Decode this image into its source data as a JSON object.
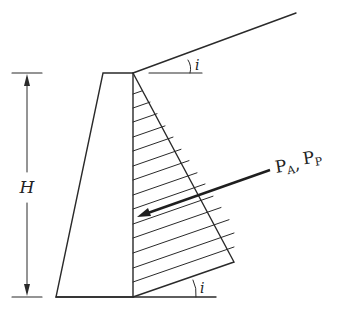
{
  "diagram": {
    "labels": {
      "height": "H",
      "slope_angle_top": "i",
      "slope_angle_bottom": "i",
      "force_main_a": "P",
      "force_sub_a": "A",
      "force_sep": ",",
      "force_main_p": "P",
      "force_sub_p": "P"
    },
    "geometry": {
      "wall": {
        "top_left": [
          103,
          73
        ],
        "top_right": [
          133,
          73
        ],
        "bottom_right": [
          133,
          297
        ],
        "bottom_left": [
          56,
          297
        ]
      },
      "backfill_slope": {
        "from": [
          133,
          73
        ],
        "to": [
          296,
          13
        ]
      },
      "top_reference_line": {
        "from": [
          149,
          73
        ],
        "to": [
          202,
          73
        ]
      },
      "ground_line": {
        "from": [
          56,
          297
        ],
        "to": [
          216,
          297
        ]
      },
      "pressure_triangle": {
        "apex": [
          133,
          73
        ],
        "outer": [
          234,
          262
        ],
        "base": [
          133,
          297
        ]
      },
      "hatch_y": [
        94,
        108,
        122,
        137,
        151,
        166,
        180,
        195,
        209,
        224,
        238,
        253,
        268,
        282
      ],
      "force_arrow": {
        "from": [
          270,
          170
        ],
        "to": [
          137,
          217
        ]
      },
      "dimension": {
        "x": 27,
        "top": 73,
        "bottom": 297,
        "tick_from": 12,
        "tick_to": 42
      }
    },
    "colors": {
      "line": "#2a2a2a",
      "background": "#ffffff"
    }
  }
}
